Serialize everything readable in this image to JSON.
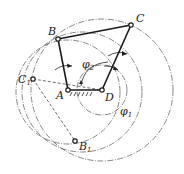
{
  "diagram": {
    "type": "four-bar linkage (crank-rocker) extreme positions",
    "points": {
      "A": {
        "label": "A",
        "x": 68,
        "y": 90
      },
      "B": {
        "label": "B",
        "x": 58,
        "y": 39
      },
      "C": {
        "label": "C",
        "x": 131,
        "y": 25
      },
      "D": {
        "label": "D",
        "x": 102,
        "y": 90
      },
      "C1": {
        "label": "C",
        "sub": "1",
        "x": 33,
        "y": 79
      },
      "B1": {
        "label": "B",
        "sub": "1",
        "x": 75,
        "y": 141
      }
    },
    "angles": {
      "phi2": {
        "label": "φ",
        "sub": "2"
      },
      "phi1": {
        "label": "φ",
        "sub": "1"
      }
    },
    "colors": {
      "link": "#1a1a1a",
      "construction": "#555555",
      "background": "#ffffff"
    }
  }
}
